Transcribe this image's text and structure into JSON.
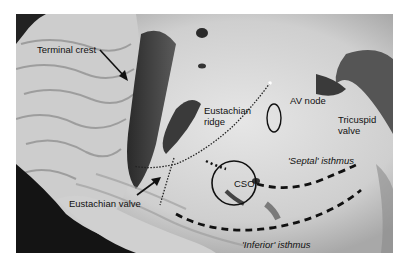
{
  "figure": {
    "labels": {
      "terminal_crest": "Terminal crest",
      "eustachian_ridge_line1": "Eustachian",
      "eustachian_ridge_line2": "ridge",
      "av_node": "AV node",
      "tricuspid_valve_line1": "Tricuspid",
      "tricuspid_valve_line2": "valve",
      "septal_isthmus": "'Septal' isthmus",
      "cso": "CSO",
      "eustachian_valve": "Eustachian valve",
      "inferior_isthmus": "'Inferior' isthmus"
    },
    "colors": {
      "background": "#ffffff",
      "tissue_light": "#d8d8d8",
      "tissue_dark": "#1a1a1a",
      "annotation": "#111111"
    }
  }
}
